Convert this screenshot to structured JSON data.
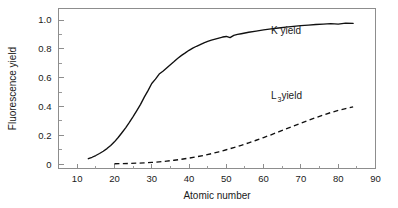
{
  "figure": {
    "background": "#ffffff",
    "frame_color": "#8d8d8d",
    "curve_color": "#101010"
  },
  "chart_data": {
    "type": "line",
    "title": "",
    "xlabel": "Atomic number",
    "ylabel": "Fluorescence yield",
    "xlim": [
      5,
      90
    ],
    "ylim": [
      -0.03,
      1.08
    ],
    "grid": false,
    "legend_position": "inline-annotation",
    "xticks": [
      10,
      20,
      30,
      40,
      50,
      60,
      70,
      80,
      90
    ],
    "xtick_labels": [
      "10",
      "20",
      "30",
      "40",
      "50",
      "60",
      "70",
      "80",
      "90"
    ],
    "xminor_ticks": [
      15,
      25,
      35,
      45,
      55,
      65,
      75,
      85
    ],
    "yticks": [
      0,
      0.2,
      0.4,
      0.6,
      0.8,
      1.0
    ],
    "ytick_labels": [
      "0",
      "0.2",
      "0.4",
      "0.6",
      "0.8",
      "1.0"
    ],
    "yminor_ticks": [
      0.1,
      0.3,
      0.5,
      0.7,
      0.9
    ],
    "series": [
      {
        "name": "K yield",
        "style": "solid",
        "label_text": "K yield",
        "label_x": 62,
        "label_y": 0.905,
        "x": [
          13,
          14,
          15,
          16,
          17,
          18,
          19,
          20,
          21,
          22,
          23,
          24,
          25,
          26,
          27,
          28,
          29,
          30,
          31,
          32,
          33,
          34,
          35,
          36,
          37,
          38,
          39,
          40,
          41,
          42,
          43,
          44,
          45,
          46,
          47,
          48,
          49,
          50,
          51,
          52,
          53,
          54,
          55,
          56,
          58,
          60,
          62,
          64,
          66,
          68,
          70,
          72,
          74,
          76,
          78,
          80,
          82,
          84
        ],
        "values": [
          0.038,
          0.048,
          0.06,
          0.074,
          0.09,
          0.108,
          0.13,
          0.155,
          0.185,
          0.218,
          0.252,
          0.29,
          0.33,
          0.372,
          0.415,
          0.465,
          0.51,
          0.56,
          0.59,
          0.625,
          0.645,
          0.668,
          0.69,
          0.712,
          0.735,
          0.755,
          0.772,
          0.79,
          0.805,
          0.818,
          0.83,
          0.842,
          0.852,
          0.861,
          0.868,
          0.875,
          0.882,
          0.886,
          0.878,
          0.893,
          0.9,
          0.905,
          0.91,
          0.915,
          0.923,
          0.932,
          0.939,
          0.945,
          0.951,
          0.956,
          0.961,
          0.965,
          0.969,
          0.972,
          0.975,
          0.972,
          0.979,
          0.977
        ]
      },
      {
        "name": "L3 yield",
        "style": "dashed",
        "label_text": " yield",
        "label_prefix": "L",
        "label_subscript": "3",
        "label_x": 62,
        "label_y": 0.452,
        "x": [
          20,
          22,
          24,
          26,
          28,
          30,
          32,
          34,
          36,
          38,
          40,
          42,
          44,
          46,
          48,
          50,
          52,
          54,
          56,
          58,
          60,
          62,
          64,
          66,
          68,
          70,
          72,
          74,
          76,
          78,
          80,
          82,
          84
        ],
        "values": [
          0.003,
          0.004,
          0.005,
          0.007,
          0.009,
          0.012,
          0.016,
          0.021,
          0.027,
          0.034,
          0.042,
          0.051,
          0.061,
          0.073,
          0.086,
          0.1,
          0.115,
          0.131,
          0.148,
          0.166,
          0.185,
          0.204,
          0.224,
          0.244,
          0.264,
          0.284,
          0.304,
          0.323,
          0.341,
          0.358,
          0.373,
          0.386,
          0.397
        ]
      }
    ]
  }
}
